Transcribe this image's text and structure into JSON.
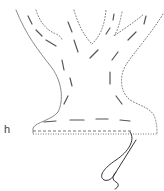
{
  "figure": {
    "label": "h"
  },
  "colors": {
    "background": "#ffffff",
    "outline": "#8a8a8a",
    "dotted_outline": "#7a7a7a",
    "dashes": "#555555",
    "string": "#333333"
  }
}
